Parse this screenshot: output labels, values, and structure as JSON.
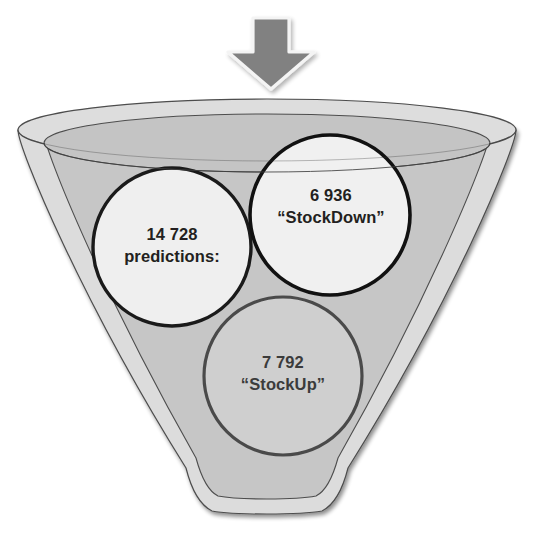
{
  "diagram": {
    "arrow": {
      "name": "input-arrow",
      "direction": "down",
      "fill": "#808080",
      "outline": "#f2f2f2"
    },
    "funnel": {
      "name": "funnel",
      "outer_fill": "#dcdcdc",
      "inner_fill": "#c4c4c4",
      "stroke": "#4d4d4d"
    },
    "circles": [
      {
        "id": "predictions",
        "lines": [
          "14 728",
          "predictions:"
        ],
        "count": "14 728",
        "label": "predictions:",
        "fill": "#efefef",
        "stroke": "#1a1a1a"
      },
      {
        "id": "stockdown",
        "lines": [
          "6 936",
          "“StockDown”"
        ],
        "count": "6 936",
        "label": "“StockDown”",
        "fill": "#f0f0f0",
        "stroke": "#111111"
      },
      {
        "id": "stockup",
        "lines": [
          "7 792",
          "“StockUp”"
        ],
        "count": "7 792",
        "label": "“StockUp”",
        "fill": "#cfcfcf",
        "stroke": "#4a4a4a"
      }
    ]
  }
}
